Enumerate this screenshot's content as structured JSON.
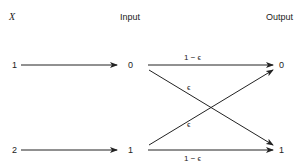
{
  "diagram": {
    "headers": {
      "x": "X",
      "input": "Input",
      "output": "Output"
    },
    "x_values": [
      "1",
      "2"
    ],
    "input_values": [
      "0",
      "1"
    ],
    "output_values": [
      "0",
      "1"
    ],
    "edges": {
      "top_straight": "1 − ϵ",
      "bottom_straight": "1 − ϵ",
      "cross_down": "ϵ",
      "cross_up": "ϵ"
    },
    "colors": {
      "line": "#222222",
      "background": "#ffffff"
    }
  }
}
